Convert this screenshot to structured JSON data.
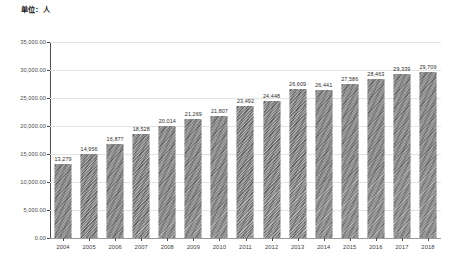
{
  "caption": {
    "unit_label": "单位：人"
  },
  "chart_data": {
    "type": "bar",
    "title": "单位：人",
    "xlabel": "",
    "ylabel": "",
    "ylim": [
      0,
      35000
    ],
    "grid": true,
    "legend": "none",
    "categories": [
      "2004",
      "2005",
      "2006",
      "2007",
      "2008",
      "2009",
      "2010",
      "2011",
      "2012",
      "2013",
      "2014",
      "2015",
      "2016",
      "2017",
      "2018"
    ],
    "values": [
      13279,
      14956,
      16877,
      18528,
      20014,
      21269,
      21807,
      23492,
      24448,
      26609,
      26441,
      27586,
      28463,
      29339,
      29709
    ],
    "value_labels": [
      "13,279",
      "14,956",
      "16,877",
      "18,528",
      "20,014",
      "21,269",
      "21,807",
      "23,492",
      "24,448",
      "26,609",
      "26,441",
      "27,586",
      "28,463",
      "29,339",
      "29,709"
    ],
    "ytick_values": [
      0,
      5000,
      10000,
      15000,
      20000,
      25000,
      30000,
      35000
    ],
    "ytick_labels": [
      "0.00",
      "5,000.00",
      "10,000.00",
      "15,000.00",
      "20,000.00",
      "25,000.00",
      "30,000.00",
      "35,000.00"
    ],
    "series_color": "#8c8c8c",
    "gridline_color": "#e3e3e3",
    "axis_color": "#4d4d4d",
    "background_color": "#ffffff"
  }
}
